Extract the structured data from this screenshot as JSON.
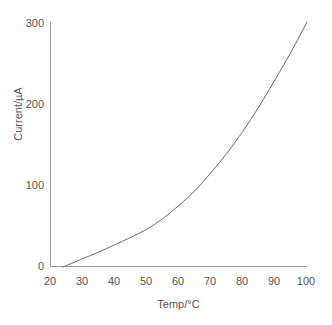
{
  "chart_data": {
    "type": "line",
    "title": "",
    "xlabel": "Temp/°C",
    "ylabel": "Current/µA",
    "xlim": [
      20,
      100
    ],
    "ylim": [
      0,
      300
    ],
    "xticks": [
      "20",
      "30",
      "40",
      "50",
      "60",
      "70",
      "80",
      "90",
      "100"
    ],
    "yticks": [
      "0",
      "100",
      "200",
      "300"
    ],
    "grid": false,
    "legend": null,
    "series": [
      {
        "name": "Current vs Temperature",
        "color": "#6b6b6b",
        "x": [
          24,
          30,
          35,
          40,
          45,
          50,
          55,
          60,
          65,
          70,
          75,
          80,
          85,
          90,
          95,
          100
        ],
        "y": [
          0,
          10,
          18,
          27,
          36,
          46,
          59,
          75,
          93,
          115,
          139,
          166,
          196,
          229,
          263,
          300
        ]
      }
    ]
  },
  "axes": {
    "y_title": "Current/µA",
    "x_title": "Temp/°C",
    "y_tick_labels": [
      "300",
      "200",
      "100",
      "0"
    ],
    "x_tick_labels": [
      "20",
      "30",
      "40",
      "50",
      "60",
      "70",
      "80",
      "90",
      "100"
    ]
  },
  "caption": {
    "clipped_text": ""
  },
  "colors": {
    "curve": "#6b6b6b",
    "axis": "#9a9a9a",
    "text": "#555555",
    "background": "#ffffff"
  }
}
